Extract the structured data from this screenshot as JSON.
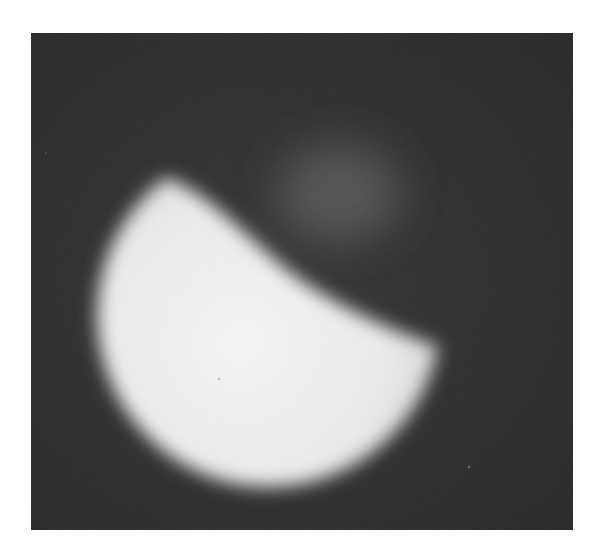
{
  "image": {
    "description": "Grayscale photograph of a bright glowing sphere partially eclipsed along a diagonal edge, with a faint dim glow above-right against a dark background",
    "colors": {
      "page_background": "#ffffff",
      "frame_background": "#2a2a2a",
      "bright_object": "#f2f2f2",
      "dim_glow": "#6a6a6a"
    }
  }
}
